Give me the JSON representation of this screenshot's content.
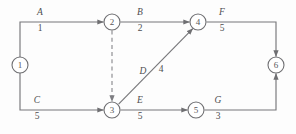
{
  "diagram": {
    "type": "aoa-network",
    "stroke_color": "#77777a",
    "text_color": "#4e4e50",
    "background": "#fdfdfd",
    "nodes": [
      {
        "id": "1",
        "label": "1",
        "x": 20,
        "y": 65
      },
      {
        "id": "2",
        "label": "2",
        "x": 112,
        "y": 22
      },
      {
        "id": "3",
        "label": "3",
        "x": 112,
        "y": 110
      },
      {
        "id": "4",
        "label": "4",
        "x": 198,
        "y": 22
      },
      {
        "id": "5",
        "label": "5",
        "x": 196,
        "y": 110
      },
      {
        "id": "6",
        "label": "6",
        "x": 276,
        "y": 65
      }
    ],
    "edges": [
      {
        "id": "A",
        "activity": "A",
        "duration": "1",
        "from": "1",
        "to": "2",
        "style": "solid",
        "label_x": 40,
        "label_act_y": 15,
        "label_dur_y": 31
      },
      {
        "id": "B",
        "activity": "B",
        "duration": "2",
        "from": "2",
        "to": "4",
        "style": "solid",
        "label_x": 140,
        "label_act_y": 15,
        "label_dur_y": 31
      },
      {
        "id": "C",
        "activity": "C",
        "duration": "5",
        "from": "1",
        "to": "3",
        "style": "solid",
        "label_x": 37,
        "label_act_y": 103,
        "label_dur_y": 119
      },
      {
        "id": "D",
        "activity": "D",
        "duration": "4",
        "from": "3",
        "to": "4",
        "style": "solid",
        "label_x": 146,
        "label_act_y": 73,
        "label_dur_y": 73
      },
      {
        "id": "E",
        "activity": "E",
        "duration": "5",
        "from": "3",
        "to": "5",
        "style": "solid",
        "label_x": 140,
        "label_act_y": 103,
        "label_dur_y": 119
      },
      {
        "id": "F",
        "activity": "F",
        "duration": "5",
        "from": "4",
        "to": "6",
        "style": "solid",
        "label_x": 222,
        "label_act_y": 15,
        "label_dur_y": 31
      },
      {
        "id": "G",
        "activity": "G",
        "duration": "3",
        "from": "5",
        "to": "6",
        "style": "solid",
        "label_x": 218,
        "label_act_y": 103,
        "label_dur_y": 119
      },
      {
        "id": "dummy",
        "activity": "",
        "duration": "",
        "from": "2",
        "to": "3",
        "style": "dashed",
        "label_x": 0,
        "label_act_y": 0,
        "label_dur_y": 0
      }
    ]
  }
}
